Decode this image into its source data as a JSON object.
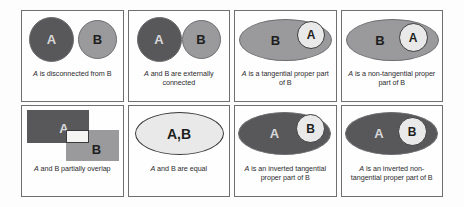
{
  "figure": {
    "colors": {
      "dark_region": "#58585b",
      "mid_region": "#9a9a9d",
      "light_region": "#e9e9e9",
      "overlap_region": "#f4f4f2",
      "cell_border": "#6f6f72",
      "caption_text": "#2c2c2e",
      "label_light": "#d8d8da",
      "label_dark": "#1e1e20",
      "background": "#fdfdfd"
    },
    "cells": [
      {
        "id": "disconnected",
        "caption_var": "A",
        "caption_rest": " is disconnected from B",
        "caption_lines": [
          "A is disconnected from B"
        ],
        "shapes": [
          {
            "name": "region-a",
            "label": "A",
            "type": "circle",
            "fill": "dark",
            "text": "light"
          },
          {
            "name": "region-b",
            "label": "B",
            "type": "circle",
            "fill": "mid",
            "text": "dark"
          }
        ]
      },
      {
        "id": "externally-connected",
        "caption_var": "A",
        "caption_rest": " and B are externally connected",
        "caption_lines": [
          "A and B are externally",
          "connected"
        ],
        "shapes": [
          {
            "name": "region-a",
            "label": "A",
            "type": "circle",
            "fill": "dark",
            "text": "light"
          },
          {
            "name": "region-b",
            "label": "B",
            "type": "circle",
            "fill": "mid",
            "text": "dark"
          }
        ]
      },
      {
        "id": "tangential-proper-part",
        "caption_var": "A",
        "caption_rest": " is a tangential proper part of B",
        "caption_lines": [
          "A is a tangential proper",
          "part of B"
        ],
        "shapes": [
          {
            "name": "region-b",
            "label": "B",
            "type": "ellipse",
            "fill": "mid",
            "text": "dark"
          },
          {
            "name": "region-a",
            "label": "A",
            "type": "circle",
            "fill": "light",
            "text": "dark"
          }
        ]
      },
      {
        "id": "non-tangential-proper-part",
        "caption_var": "A",
        "caption_rest": " is a non-tangential proper part of B",
        "caption_lines": [
          "A is a non-tangential",
          "proper part of B"
        ],
        "shapes": [
          {
            "name": "region-b",
            "label": "B",
            "type": "ellipse",
            "fill": "mid",
            "text": "dark"
          },
          {
            "name": "region-a",
            "label": "A",
            "type": "circle",
            "fill": "light",
            "text": "dark"
          }
        ]
      },
      {
        "id": "partially-overlap",
        "caption_var": "A",
        "caption_rest": " and B partially overlap",
        "caption_lines": [
          "A and B partially overlap"
        ],
        "shapes": [
          {
            "name": "region-a",
            "label": "A",
            "type": "rect",
            "fill": "dark",
            "text": "light"
          },
          {
            "name": "region-b",
            "label": "B",
            "type": "rect",
            "fill": "mid",
            "text": "dark"
          },
          {
            "name": "overlap-region",
            "label": "",
            "type": "rect",
            "fill": "white",
            "text": "dark"
          }
        ]
      },
      {
        "id": "equal",
        "caption_var": "A",
        "caption_rest": " and B are equal",
        "caption_lines": [
          "A and B are equal"
        ],
        "shapes": [
          {
            "name": "region-ab",
            "label": "A,B",
            "type": "ellipse",
            "fill": "light",
            "text": "dark"
          }
        ]
      },
      {
        "id": "inverted-tangential-proper-part",
        "caption_var": "A",
        "caption_rest": " is an inverted tangential proper part of B",
        "caption_lines": [
          "A is an inverted tangential",
          "proper part of B"
        ],
        "shapes": [
          {
            "name": "region-a",
            "label": "A",
            "type": "ellipse",
            "fill": "dark",
            "text": "light"
          },
          {
            "name": "region-b",
            "label": "B",
            "type": "circle",
            "fill": "light",
            "text": "dark"
          }
        ]
      },
      {
        "id": "inverted-non-tangential-proper-part",
        "caption_var": "A",
        "caption_rest": " is an inverted non-tangential proper part of B",
        "caption_lines": [
          "A is an inverted",
          "non-tangential",
          "proper part of B"
        ],
        "shapes": [
          {
            "name": "region-a",
            "label": "A",
            "type": "ellipse",
            "fill": "dark",
            "text": "light"
          },
          {
            "name": "region-b",
            "label": "B",
            "type": "circle",
            "fill": "light",
            "text": "dark"
          }
        ]
      }
    ]
  }
}
